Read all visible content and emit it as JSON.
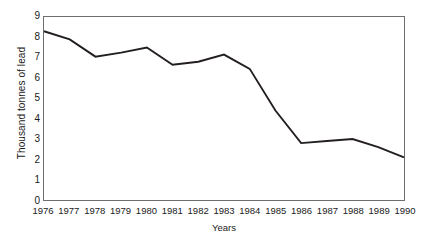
{
  "chart_data": {
    "type": "line",
    "title": "",
    "xlabel": "Years",
    "ylabel": "Thousand tonnes of lead",
    "categories": [
      "1976",
      "1977",
      "1978",
      "1979",
      "1980",
      "1981",
      "1982",
      "1983",
      "1984",
      "1985",
      "1986",
      "1987",
      "1988",
      "1989",
      "1990"
    ],
    "values": [
      8.3,
      7.9,
      7.05,
      7.25,
      7.5,
      6.65,
      6.8,
      7.15,
      6.45,
      4.4,
      2.8,
      2.9,
      3.0,
      2.6,
      2.1
    ],
    "series": [
      {
        "name": "Lead consumption",
        "values": [
          8.3,
          7.9,
          7.05,
          7.25,
          7.5,
          6.65,
          6.8,
          7.15,
          6.45,
          4.4,
          2.8,
          2.9,
          3.0,
          2.6,
          2.1
        ]
      }
    ],
    "xlim": [
      1976,
      1990
    ],
    "ylim": [
      0,
      9
    ],
    "yticks": [
      "0",
      "1",
      "2",
      "3",
      "4",
      "5",
      "6",
      "7",
      "8",
      "9"
    ],
    "ytick_values": [
      0,
      1,
      2,
      3,
      4,
      5,
      6,
      7,
      8,
      9
    ],
    "grid": false,
    "legend": false,
    "legend_position": "none",
    "line_color": "#231f20",
    "axis_color": "#6e6e6e",
    "background_color": "#ffffff"
  }
}
